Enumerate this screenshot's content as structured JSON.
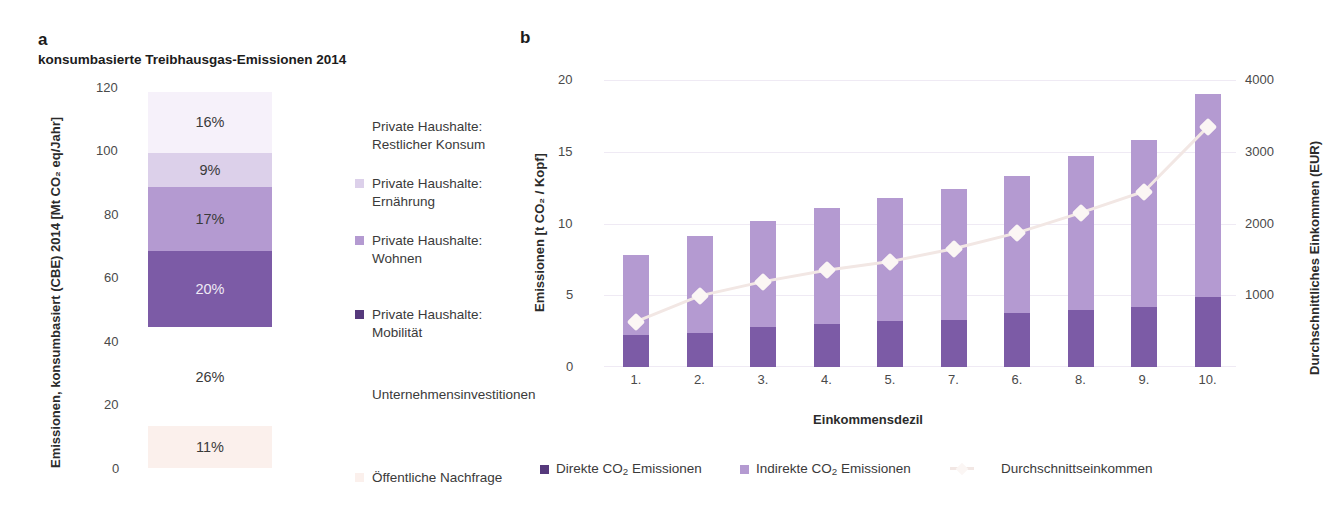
{
  "panel_a": {
    "letter": "a",
    "subtitle": "konsumbasierte Treibhausgas-Emissionen 2014",
    "y_axis_title": "Emissionen, konsumbasiert (CBE) 2014 [Mt CO₂ eq/Jahr]",
    "y_ticks": [
      "120",
      "100",
      "80",
      "60",
      "40",
      "20",
      "0"
    ],
    "legend": [
      {
        "label": "Private Haushalte:\nRestlicher Konsum",
        "color": "#f6f1fa",
        "has_swatch": false
      },
      {
        "label": "Private Haushalte:\nErnährung",
        "color": "#dcd0ea",
        "has_swatch": true
      },
      {
        "label": "Private Haushalte:\nWohnen",
        "color": "#b49ad1",
        "has_swatch": true
      },
      {
        "label": "Private Haushalte:\nMobilität",
        "color": "#7c5ba6",
        "has_swatch": true
      },
      {
        "label": "Unternehmensinvestitionen",
        "color": "#ffffff",
        "has_swatch": false
      },
      {
        "label": "Öffentliche Nachfrage",
        "color": "#fbf0ec",
        "has_swatch": false
      }
    ]
  },
  "panel_b": {
    "letter": "b",
    "y_axis_title": "Emissionen [t CO₂ / Kopf]",
    "y2_axis_title": "Durchschnittliches Einkommen (EUR)",
    "x_axis_title": "Einkommensdezil",
    "y_ticks": [
      "20",
      "15",
      "10",
      "5",
      "0"
    ],
    "y2_ticks": [
      "4000",
      "3000",
      "2000",
      "1000"
    ],
    "legend": [
      {
        "label_html": "Direkte CO<sub>2</sub> Emissionen",
        "color": "#7c5ba6",
        "type": "swatch"
      },
      {
        "label_html": "Indirekte CO<sub>2</sub> Emissionen",
        "color": "#b49ad1",
        "type": "swatch"
      },
      {
        "label_html": "Durchschnittseinkommen",
        "color": "#f2e7e4",
        "type": "line"
      }
    ]
  },
  "colors": {
    "restlicher_konsum": "#f6f1fa",
    "ernaehrung": "#dcd0ea",
    "wohnen": "#b49ad1",
    "mobilitaet": "#7c5ba6",
    "unternehmen": "#ffffff",
    "oeffentlich": "#fbf0ec",
    "direkt": "#7c5ba6",
    "indirekt": "#b49ad1",
    "income_line": "#f2e7e4",
    "marker": "#fbf6f4",
    "grid": "#efeaf4"
  },
  "chart_data": [
    {
      "type": "bar",
      "id": "panel-a-stacked",
      "title": "konsumbasierte Treibhausgas-Emissionen 2014",
      "xlabel": "",
      "ylabel": "Emissionen, konsumbasiert (CBE) 2014 [Mt CO₂ eq/Jahr]",
      "ylim": [
        0,
        120
      ],
      "yticks": [
        0,
        20,
        40,
        60,
        80,
        100,
        120
      ],
      "grid": false,
      "stacked": true,
      "categories": [
        "Gesamt"
      ],
      "series": [
        {
          "name": "Öffentliche Nachfrage",
          "percent": 11,
          "value": 13.2,
          "y_from": 0,
          "y_to": 13.2,
          "color": "#fbf0ec",
          "data_label": "11%"
        },
        {
          "name": "Unternehmensinvestitionen",
          "percent": 26,
          "value": 31.2,
          "y_from": 13.2,
          "y_to": 44.4,
          "color": "#ffffff",
          "data_label": "26%"
        },
        {
          "name": "Private Haushalte: Mobilität",
          "percent": 20,
          "value": 24.0,
          "y_from": 44.4,
          "y_to": 68.4,
          "color": "#7c5ba6",
          "data_label": "20%"
        },
        {
          "name": "Private Haushalte: Wohnen",
          "percent": 17,
          "value": 20.4,
          "y_from": 68.4,
          "y_to": 88.8,
          "color": "#b49ad1",
          "data_label": "17%"
        },
        {
          "name": "Private Haushalte: Ernährung",
          "percent": 9,
          "value": 10.8,
          "y_from": 88.8,
          "y_to": 99.6,
          "color": "#dcd0ea",
          "data_label": "9%"
        },
        {
          "name": "Private Haushalte: Restlicher Konsum",
          "percent": 16,
          "value": 19.2,
          "y_from": 99.6,
          "y_to": 118.8,
          "color": "#f6f1fa",
          "data_label": "16%"
        }
      ]
    },
    {
      "type": "bar",
      "id": "panel-b-stacked-with-line",
      "title": "",
      "xlabel": "Einkommensdezil",
      "ylabel": "Emissionen [t CO₂ / Kopf]",
      "y2label": "Durchschnittliches Einkommen (EUR)",
      "ylim": [
        0,
        20
      ],
      "yticks": [
        0,
        5,
        10,
        15,
        20
      ],
      "y2lim": [
        0,
        4000
      ],
      "y2ticks": [
        1000,
        2000,
        3000,
        4000
      ],
      "grid": true,
      "stacked": true,
      "legend_position": "bottom",
      "categories": [
        "1.",
        "2.",
        "3.",
        "4.",
        "5.",
        "7.",
        "6.",
        "8.",
        "9.",
        "10."
      ],
      "series": [
        {
          "name": "Direkte CO₂ Emissionen",
          "color": "#7c5ba6",
          "values": [
            2.2,
            2.4,
            2.8,
            3.0,
            3.2,
            3.3,
            3.8,
            4.0,
            4.2,
            4.9
          ]
        },
        {
          "name": "Indirekte CO₂ Emissionen",
          "color": "#b49ad1",
          "values": [
            5.6,
            6.7,
            7.4,
            8.1,
            8.6,
            9.1,
            9.5,
            10.7,
            11.6,
            14.1
          ]
        }
      ],
      "totals": [
        7.8,
        9.1,
        10.2,
        11.1,
        11.8,
        12.4,
        13.3,
        14.7,
        15.8,
        19.0
      ],
      "line_series": {
        "name": "Durchschnittseinkommen",
        "axis": "y2",
        "color": "#f2e7e4",
        "marker": "diamond",
        "values": [
          620,
          980,
          1180,
          1340,
          1460,
          1640,
          1860,
          2140,
          2440,
          3340
        ]
      }
    }
  ]
}
